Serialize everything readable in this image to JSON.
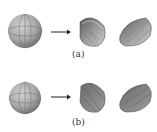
{
  "figure": {
    "panels": [
      {
        "id": "a",
        "label": "(a)",
        "description": "Sphere cut into two hollow hemisphere shells, shown from inside"
      },
      {
        "id": "b",
        "label": "(b)",
        "description": "Sphere cut into two solid hemispheres, shown with flat cut faces"
      }
    ],
    "colors": {
      "shape_dark": "#555555",
      "shape_light": "#bdbdbd",
      "grid": "#6e6e6e",
      "arrow": "#222222"
    }
  }
}
